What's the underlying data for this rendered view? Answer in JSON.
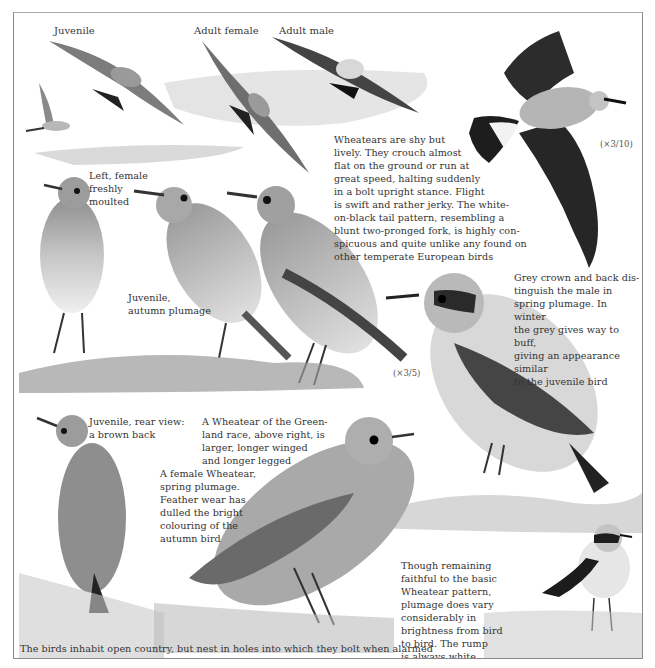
{
  "plate": {
    "subject": "Wheatear",
    "flight_labels": [
      {
        "id": "juvenile",
        "text": "Juvenile"
      },
      {
        "id": "adult-female",
        "text": "Adult female"
      },
      {
        "id": "adult-male",
        "text": "Adult male"
      }
    ],
    "scales": {
      "flight": "(×3/10)",
      "perched": "(×3/5)"
    },
    "captions": {
      "behaviour": "Wheatears are shy but\nlively. They crouch almost\nflat on the ground or run at\ngreat speed, halting suddenly\nin a bolt upright stance. Flight\nis swift and rather jerky. The white-\non-black tail pattern, resembling a\nblunt two-pronged fork, is highly con-\nspicuous and quite unlike any found on\nother temperate European birds",
      "female_moulted": "Left, female\nfreshly\nmoulted",
      "juvenile_autumn": "Juvenile,\nautumn plumage",
      "male_spring": "Grey crown and back dis-\ntinguish the male in\nspring plumage. In winter\nthe grey gives way to buff,\ngiving an appearance similar\nto the juvenile bird",
      "juvenile_rear": "Juvenile, rear view:\na brown back",
      "greenland_race": "A Wheatear of the Green-\nland race, above right, is\nlarger, longer winged\nand longer legged",
      "female_spring": "A female Wheatear,\nspring plumage.\nFeather wear has\ndulled the bright\ncolouring of the\nautumn bird",
      "variation": "Though remaining\nfaithful to the basic\nWheatear pattern,\nplumage does vary\nconsiderably in\nbrightness from bird\nto bird. The rump\nis always white",
      "habitat": "The birds inhabit open country, but nest in holes into which they bolt when alarmed"
    }
  }
}
